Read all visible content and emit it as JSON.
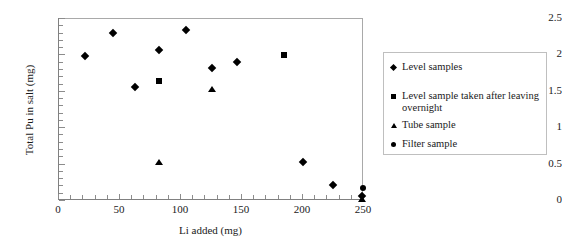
{
  "chart_data": {
    "type": "scatter",
    "title": "",
    "xlabel": "Li added (mg)",
    "ylabel": "Total Pu in salt (mg)",
    "xlim": [
      0,
      250
    ],
    "ylim": [
      0,
      2.5
    ],
    "xticks": [
      "0",
      "50",
      "100",
      "150",
      "200",
      "250"
    ],
    "xtick_values": [
      0,
      50,
      100,
      150,
      200,
      250
    ],
    "yticks": [
      "0",
      "0.5",
      "1",
      "1.5",
      "2",
      "2.5"
    ],
    "ytick_values": [
      0,
      0.5,
      1,
      1.5,
      2,
      2.5
    ],
    "grid": false,
    "legend_position": "right-outside",
    "series": [
      {
        "name": "Level samples",
        "marker": "diamond",
        "color": "#000000",
        "points": [
          {
            "x": 22,
            "y": 1.98
          },
          {
            "x": 45,
            "y": 2.3
          },
          {
            "x": 63,
            "y": 1.55
          },
          {
            "x": 83,
            "y": 2.06
          },
          {
            "x": 105,
            "y": 2.34
          },
          {
            "x": 126,
            "y": 1.81
          },
          {
            "x": 147,
            "y": 1.9
          },
          {
            "x": 201,
            "y": 0.52
          },
          {
            "x": 225,
            "y": 0.21
          },
          {
            "x": 249,
            "y": 0.05
          }
        ]
      },
      {
        "name": "Level sample taken after leaving overnight",
        "marker": "square",
        "color": "#000000",
        "points": [
          {
            "x": 83,
            "y": 1.64
          },
          {
            "x": 185,
            "y": 1.99
          }
        ]
      },
      {
        "name": "Tube sample",
        "marker": "triangle",
        "color": "#000000",
        "points": [
          {
            "x": 83,
            "y": 0.52
          },
          {
            "x": 126,
            "y": 1.52
          },
          {
            "x": 249,
            "y": 0.02
          }
        ]
      },
      {
        "name": "Filter sample",
        "marker": "circle",
        "color": "#000000",
        "points": [
          {
            "x": 250,
            "y": 0.17
          }
        ]
      }
    ]
  },
  "legend": {
    "items": [
      {
        "label": "Level samples",
        "marker": "diamond"
      },
      {
        "label": "Level sample taken after leaving overnight",
        "marker": "square"
      },
      {
        "label": "Tube sample",
        "marker": "triangle"
      },
      {
        "label": "Filter sample",
        "marker": "circle"
      }
    ]
  },
  "axes": {
    "x_title": "Li added (mg)",
    "y_title": "Total Pu in salt (mg)"
  }
}
